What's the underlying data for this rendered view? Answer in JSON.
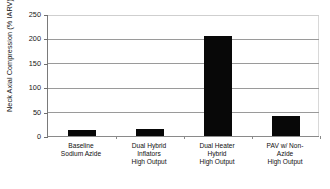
{
  "chart_data": {
    "type": "bar",
    "title": "",
    "xlabel": "",
    "ylabel": "Neck Axial Compression (% IARV)",
    "ylim": [
      0,
      250
    ],
    "ytick_values": [
      250,
      200,
      150,
      100,
      50,
      0
    ],
    "ytick_labels": [
      "250",
      "200",
      "150",
      "100",
      "50",
      "0"
    ],
    "grid": true,
    "grid_axis": "y",
    "legend": null,
    "bar_color": "#080808",
    "categories": [
      "Baseline\nSodium Azide",
      "Dual Hybrid\nInflators\nHigh Output",
      "Dual Heater\nHybrid\nHigh Output",
      "PAV w/ Non-\nAzide\nHigh Output"
    ],
    "values": [
      13,
      14,
      205,
      40
    ],
    "series": [
      {
        "name": "Neck Axial Compression (% IARV)",
        "values": [
          13,
          14,
          205,
          40
        ]
      }
    ]
  },
  "axis": {
    "y_title": "Neck Axial Compression (% IARV)"
  }
}
